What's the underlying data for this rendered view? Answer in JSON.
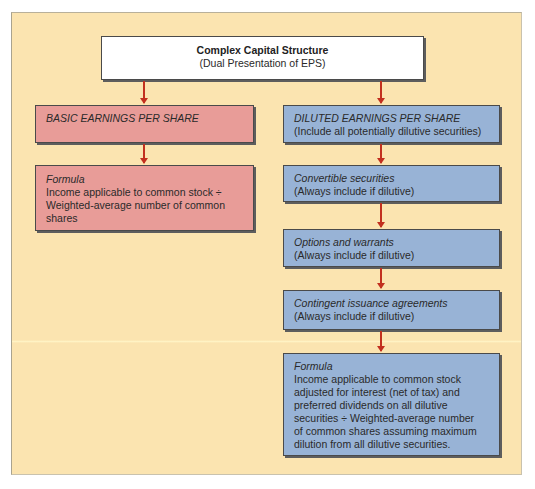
{
  "diagram": {
    "root": {
      "title": "Complex Capital Structure",
      "subtitle": "(Dual Presentation of EPS)"
    },
    "basic": {
      "heading": "BASIC EARNINGS PER SHARE",
      "formula": {
        "label": "Formula",
        "lines": [
          "Income applicable to common stock ÷",
          "Weighted-average number of common",
          "shares"
        ]
      }
    },
    "diluted": {
      "heading": "DILUTED EARNINGS PER SHARE",
      "note": "(Include all potentially dilutive securities)",
      "steps": [
        {
          "label": "Convertible securities",
          "note": "(Always include if dilutive)"
        },
        {
          "label": "Options and warrants",
          "note": "(Always include if dilutive)"
        },
        {
          "label": "Contingent issuance agreements",
          "note": "(Always include if dilutive)"
        }
      ],
      "formula": {
        "label": "Formula",
        "lines": [
          "Income applicable to common stock",
          "adjusted for interest (net of tax) and",
          "preferred dividends on all dilutive",
          "securities ÷ Weighted-average number",
          "of common shares assuming maximum",
          "dilution from all dilutive securities."
        ]
      }
    },
    "colors": {
      "background": "#fbe4b0",
      "basic_box": "#e89c98",
      "diluted_box": "#98b3d6",
      "root_box": "#ffffff",
      "arrow": "#c2301f"
    }
  }
}
